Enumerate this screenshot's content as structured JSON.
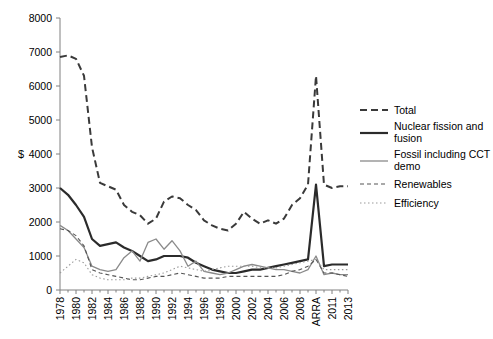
{
  "chart_data": {
    "type": "line",
    "title": "",
    "xlabel": "",
    "ylabel": "$",
    "ylim": [
      0,
      8000
    ],
    "ytick_step": 1000,
    "grid": false,
    "legend_position": "right",
    "yticks": [
      "0",
      "1000",
      "2000",
      "3000",
      "4000",
      "5000",
      "6000",
      "7000",
      "8000"
    ],
    "x": [
      "1978",
      "1979",
      "1980",
      "1981",
      "1982",
      "1983",
      "1984",
      "1985",
      "1986",
      "1987",
      "1988",
      "1989",
      "1990",
      "1991",
      "1992",
      "1993",
      "1994",
      "1995",
      "1996",
      "1997",
      "1998",
      "1999",
      "2000",
      "2001",
      "2002",
      "2003",
      "2004",
      "2005",
      "2006",
      "2007",
      "2008",
      "2009",
      "ARRA",
      "2010",
      "2011",
      "2012",
      "2013"
    ],
    "xtick_labels": [
      "1978",
      "1980",
      "1982",
      "1984",
      "1986",
      "1988",
      "1990",
      "1992",
      "1994",
      "1996",
      "1998",
      "2000",
      "2002",
      "2004",
      "2006",
      "2008",
      "ARRA",
      "2011",
      "2013"
    ],
    "series": [
      {
        "name": "Total",
        "style": "dashed-thick",
        "values": [
          6850,
          6900,
          6800,
          6300,
          4200,
          3150,
          3050,
          2950,
          2500,
          2300,
          2200,
          1950,
          2100,
          2600,
          2750,
          2700,
          2500,
          2350,
          2050,
          1900,
          1800,
          1750,
          1950,
          2300,
          2100,
          1950,
          2050,
          1950,
          2100,
          2500,
          2700,
          3100,
          6300,
          3100,
          3000,
          3050,
          3050
        ]
      },
      {
        "name": "Nuclear fission and fusion",
        "style": "solid-thick",
        "values": [
          3000,
          2800,
          2500,
          2150,
          1500,
          1300,
          1350,
          1400,
          1250,
          1150,
          1000,
          850,
          900,
          1000,
          1000,
          1000,
          950,
          800,
          700,
          600,
          550,
          500,
          500,
          550,
          600,
          600,
          650,
          700,
          750,
          800,
          850,
          900,
          3100,
          700,
          750,
          750,
          750
        ]
      },
      {
        "name": "Fossil including CCT demo",
        "style": "solid-thin",
        "values": [
          1900,
          1750,
          1500,
          1250,
          700,
          600,
          550,
          600,
          950,
          1150,
          850,
          1400,
          1500,
          1200,
          1450,
          1150,
          700,
          850,
          550,
          500,
          450,
          500,
          600,
          700,
          750,
          700,
          650,
          600,
          600,
          550,
          500,
          600,
          1000,
          450,
          500,
          450,
          450
        ]
      },
      {
        "name": "Renewables",
        "style": "dashed-thin",
        "values": [
          1800,
          1750,
          1600,
          1300,
          600,
          500,
          450,
          400,
          350,
          300,
          300,
          350,
          400,
          400,
          450,
          500,
          450,
          400,
          350,
          350,
          350,
          400,
          400,
          400,
          400,
          400,
          400,
          400,
          450,
          550,
          600,
          700,
          900,
          500,
          500,
          450,
          400
        ]
      },
      {
        "name": "Efficiency",
        "style": "dotted",
        "values": [
          500,
          700,
          900,
          800,
          450,
          350,
          300,
          300,
          300,
          350,
          350,
          400,
          450,
          500,
          600,
          700,
          650,
          600,
          550,
          600,
          650,
          700,
          700,
          700,
          700,
          650,
          650,
          650,
          700,
          750,
          800,
          850,
          900,
          600,
          600,
          600,
          600
        ]
      }
    ]
  },
  "legend": {
    "items": [
      {
        "label": "Total"
      },
      {
        "label": "Nuclear fission and fusion"
      },
      {
        "label": "Fossil including CCT demo"
      },
      {
        "label": "Renewables"
      },
      {
        "label": "Efficiency"
      }
    ]
  }
}
